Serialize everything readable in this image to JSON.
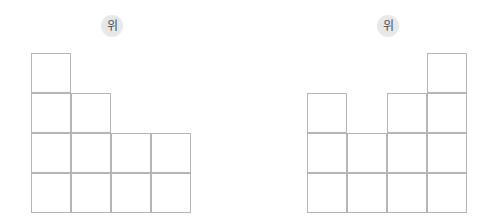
{
  "page": {
    "background_color": "#ffffff",
    "width": 496,
    "height": 223
  },
  "figures": [
    {
      "id": "figure-left",
      "name": "left-cube-stack",
      "direction_badge": {
        "label": "위",
        "meaning": "top",
        "background_color": "#e8e8e8",
        "text_color": "#4a4a4a"
      },
      "grid": {
        "columns": 4,
        "rows": 4,
        "cell_size": 40,
        "line_color": "#b5b5b5",
        "origin_x": 31,
        "origin_y": 53
      },
      "column_heights": [
        4,
        3,
        2,
        2
      ],
      "total_cells": 11,
      "occupancy": [
        [
          1,
          0,
          0,
          0
        ],
        [
          1,
          1,
          0,
          0
        ],
        [
          1,
          1,
          1,
          1
        ],
        [
          1,
          1,
          1,
          1
        ]
      ]
    },
    {
      "id": "figure-right",
      "name": "right-cube-stack",
      "direction_badge": {
        "label": "위",
        "meaning": "top",
        "background_color": "#e8e8e8",
        "text_color": "#4a4a4a"
      },
      "grid": {
        "columns": 4,
        "rows": 4,
        "cell_size": 40,
        "line_color": "#b5b5b5",
        "origin_x": 307,
        "origin_y": 53
      },
      "column_heights": [
        3,
        2,
        3,
        4
      ],
      "total_cells": 12,
      "occupancy": [
        [
          0,
          0,
          0,
          1
        ],
        [
          1,
          0,
          1,
          1
        ],
        [
          1,
          1,
          1,
          1
        ],
        [
          1,
          1,
          1,
          1
        ]
      ]
    }
  ]
}
